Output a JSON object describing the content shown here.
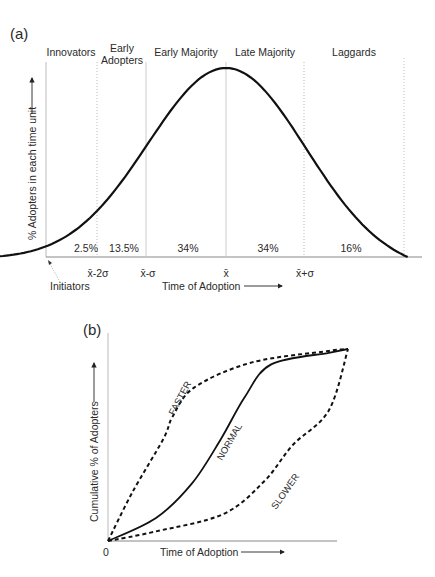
{
  "panel_a": {
    "label": "(a)",
    "ylabel": "% Adopters in each time unit",
    "xlabel": "Time of Adoption",
    "categories": [
      {
        "name": "Innovators",
        "lines": [
          "Innovators"
        ],
        "share": "2.5%"
      },
      {
        "name": "Early Adopters",
        "lines": [
          "Early",
          "Adopters"
        ],
        "share": "13.5%"
      },
      {
        "name": "Early Majority",
        "lines": [
          "Early Majority"
        ],
        "share": "34%"
      },
      {
        "name": "Late Majority",
        "lines": [
          "Late Majority"
        ],
        "share": "34%"
      },
      {
        "name": "Laggards",
        "lines": [
          "Laggards"
        ],
        "share": "16%"
      }
    ],
    "ticks": [
      "x̄-2σ",
      "x̄-σ",
      "x̄",
      "x̄+σ"
    ],
    "annotation": "Initiators"
  },
  "panel_b": {
    "label": "(b)",
    "ylabel": "Cumulative % of Adopters",
    "xlabel": "Time of Adoption",
    "origin_label": "0",
    "curves": [
      {
        "name": "FASTER",
        "style": "dashed"
      },
      {
        "name": "NORMAL",
        "style": "solid"
      },
      {
        "name": "SLOWER",
        "style": "dashed"
      }
    ]
  },
  "chart_data": [
    {
      "type": "line",
      "title": "(a)",
      "xlabel": "Time of Adoption",
      "ylabel": "% Adopters in each time unit",
      "description": "Bell-shaped (normal) adoption curve partitioned by standard deviations from the mean",
      "x_ticks": [
        "x̄-2σ",
        "x̄-σ",
        "x̄",
        "x̄+σ"
      ],
      "x_range_sigma": [
        -3,
        2.3
      ],
      "categories": [
        "Innovators",
        "Early Adopters",
        "Early Majority",
        "Late Majority",
        "Laggards"
      ],
      "values": [
        2.5,
        13.5,
        34,
        34,
        16
      ],
      "boundaries_sigma": [
        -2,
        -1,
        0,
        1
      ],
      "grid": false
    },
    {
      "type": "line",
      "title": "(b)",
      "xlabel": "Time of Adoption",
      "ylabel": "Cumulative % of Adopters",
      "x_range": [
        0,
        1
      ],
      "y_range": [
        0,
        1
      ],
      "series": [
        {
          "name": "FASTER",
          "style": "dashed",
          "x": [
            0,
            0.1,
            0.23,
            0.27,
            0.36,
            0.6,
            0.92,
            1.0
          ],
          "y": [
            0,
            0.25,
            0.53,
            0.65,
            0.8,
            0.93,
            0.99,
            1.0
          ]
        },
        {
          "name": "NORMAL",
          "style": "solid",
          "x": [
            0,
            0.2,
            0.35,
            0.47,
            0.57,
            0.68,
            0.92,
            1.0
          ],
          "y": [
            0,
            0.12,
            0.3,
            0.53,
            0.75,
            0.92,
            0.98,
            1.0
          ]
        },
        {
          "name": "SLOWER",
          "style": "dashed",
          "x": [
            0,
            0.2,
            0.48,
            0.65,
            0.77,
            0.92,
            1.0
          ],
          "y": [
            0,
            0.05,
            0.14,
            0.31,
            0.5,
            0.68,
            1.0
          ]
        }
      ],
      "grid": false,
      "legend": "inline labels on curves"
    }
  ]
}
